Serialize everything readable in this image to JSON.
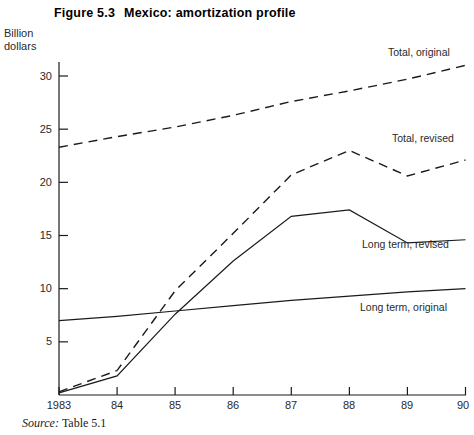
{
  "figure": {
    "number": "Figure 5.3",
    "title": "Mexico: amortization profile",
    "source_word": "Source:",
    "source_ref": "Table 5.1"
  },
  "axis": {
    "unit_line1": "Billion",
    "unit_line2": "dollars",
    "y_ticks": [
      "5",
      "10",
      "15",
      "20",
      "25",
      "30"
    ],
    "x_ticks": [
      "1983",
      "84",
      "85",
      "86",
      "87",
      "88",
      "89",
      "90"
    ]
  },
  "series_labels": {
    "total_original": "Total, original",
    "total_revised": "Total, revised",
    "long_term_revised": "Long term, revised",
    "long_term_original": "Long term, original"
  },
  "chart_data": {
    "type": "line",
    "title": "Mexico: amortization profile",
    "xlabel": "",
    "ylabel": "Billion dollars",
    "x": [
      "1983",
      "84",
      "85",
      "86",
      "87",
      "88",
      "89",
      "90"
    ],
    "ylim": [
      0,
      30
    ],
    "xlim": [
      "1983",
      "90"
    ],
    "ytick_values": [
      5,
      10,
      15,
      20,
      25,
      30
    ],
    "grid": false,
    "legend": "inline-annotations",
    "series": [
      {
        "name": "Total, original",
        "style": "dashed",
        "values": [
          23.3,
          24.3,
          25.2,
          26.3,
          27.6,
          28.6,
          29.7,
          31.0
        ]
      },
      {
        "name": "Total, revised",
        "style": "dashed",
        "values": [
          0.3,
          2.3,
          9.8,
          15.2,
          20.7,
          23.0,
          20.6,
          22.1
        ]
      },
      {
        "name": "Long term, revised",
        "style": "solid",
        "values": [
          0.2,
          1.8,
          7.6,
          12.6,
          16.8,
          17.4,
          14.3,
          14.6
        ]
      },
      {
        "name": "Long term, original",
        "style": "solid",
        "values": [
          7.0,
          7.4,
          7.9,
          8.4,
          8.9,
          9.3,
          9.7,
          10.0
        ]
      }
    ]
  },
  "colors": {
    "ink": "#1a1a1a",
    "background": "#ffffff"
  }
}
